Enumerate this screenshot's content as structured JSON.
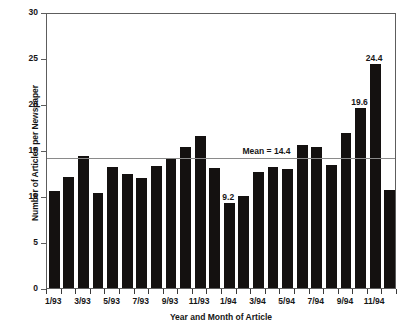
{
  "chart_data": {
    "type": "bar",
    "title": "",
    "xlabel": "Year and Month of Article",
    "ylabel": "Number of Articles per Newspaper",
    "ylim": [
      0,
      30
    ],
    "yticks": [
      0,
      5,
      10,
      15,
      20,
      25,
      30
    ],
    "grid": false,
    "legend": "none",
    "bar_color": "#141110",
    "mean_line_color": "#8a8a8a",
    "axis_color": "#5d5d5d",
    "categories": [
      "1/93",
      "2/93",
      "3/93",
      "4/93",
      "5/93",
      "6/93",
      "7/93",
      "8/93",
      "9/93",
      "10/93",
      "11/93",
      "12/93",
      "1/94",
      "2/94",
      "3/94",
      "4/94",
      "5/94",
      "6/94",
      "7/94",
      "8/94",
      "9/94",
      "10/94",
      "11/94",
      "12/94"
    ],
    "tick_labels": [
      "1/93",
      "3/93",
      "5/93",
      "7/93",
      "9/93",
      "11/93",
      "1/94",
      "3/94",
      "5/94",
      "7/94",
      "9/94",
      "11/94"
    ],
    "values": [
      10.5,
      12.1,
      14.3,
      10.3,
      13.2,
      12.4,
      12.0,
      13.3,
      14.1,
      15.3,
      16.5,
      13.0,
      9.2,
      10.0,
      12.6,
      13.1,
      12.9,
      15.5,
      15.3,
      13.4,
      16.8,
      19.6,
      24.4,
      10.7
    ],
    "annotations": [
      {
        "label": "Mean = 14.4",
        "value": 14.4,
        "type": "mean-line"
      },
      {
        "label": "9.2",
        "value": 9.2,
        "index": 12,
        "type": "bar-value"
      },
      {
        "label": "19.6",
        "value": 19.6,
        "index": 21,
        "type": "bar-value"
      },
      {
        "label": "24.4",
        "value": 24.4,
        "index": 22,
        "type": "bar-value"
      }
    ],
    "mean": 14.4
  },
  "axes": {
    "y_title": "Number of Articles per Newspaper",
    "x_title": "Year and Month of Article",
    "y_ticks": [
      "30",
      "25",
      "20",
      "15",
      "10",
      "5",
      "0"
    ]
  },
  "labels": {
    "mean_text": "Mean = 14.4",
    "value_9_2": "9.2",
    "value_19_6": "19.6",
    "value_24_4": "24.4"
  }
}
